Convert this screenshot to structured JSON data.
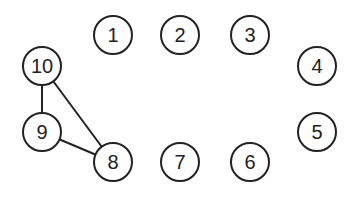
{
  "diagram": {
    "type": "graph",
    "style": {
      "stroke": "#222222",
      "fill": "#ffffff",
      "node_radius": 19
    },
    "nodes": [
      {
        "id": "1",
        "label": "1",
        "x": 113,
        "y": 35
      },
      {
        "id": "2",
        "label": "2",
        "x": 180,
        "y": 35
      },
      {
        "id": "3",
        "label": "3",
        "x": 250,
        "y": 35
      },
      {
        "id": "4",
        "label": "4",
        "x": 317,
        "y": 66
      },
      {
        "id": "5",
        "label": "5",
        "x": 317,
        "y": 132
      },
      {
        "id": "6",
        "label": "6",
        "x": 250,
        "y": 162
      },
      {
        "id": "7",
        "label": "7",
        "x": 180,
        "y": 162
      },
      {
        "id": "8",
        "label": "8",
        "x": 113,
        "y": 162
      },
      {
        "id": "9",
        "label": "9",
        "x": 42,
        "y": 132
      },
      {
        "id": "10",
        "label": "10",
        "x": 42,
        "y": 66
      }
    ],
    "edges": [
      {
        "from": "10",
        "to": "9"
      },
      {
        "from": "10",
        "to": "8"
      },
      {
        "from": "9",
        "to": "8"
      }
    ]
  }
}
